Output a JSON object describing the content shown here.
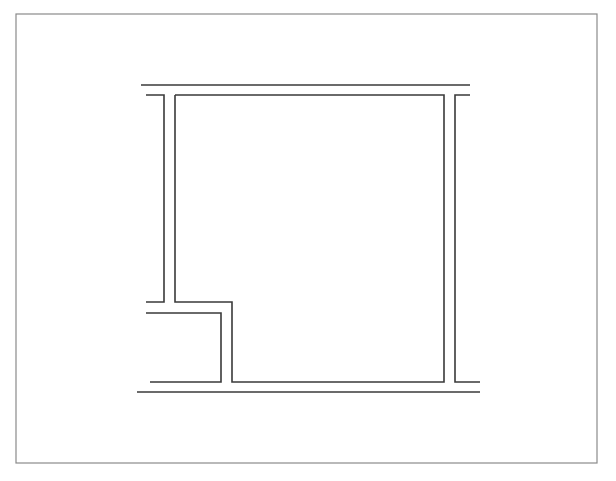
{
  "diagram": {
    "type": "floor-plan",
    "background": "#ffffff",
    "stroke_color": "#3a3a3a",
    "frame_color": "#8a8a8a",
    "frame": {
      "x": 16,
      "y": 14,
      "width": 581,
      "height": 449
    },
    "walls": [
      {
        "id": "top-line",
        "points": [
          [
            141,
            85
          ],
          [
            470,
            85
          ]
        ]
      },
      {
        "id": "left-outer-wall",
        "points": [
          [
            146,
            95
          ],
          [
            164,
            95
          ],
          [
            164,
            302
          ],
          [
            146,
            302
          ]
        ]
      },
      {
        "id": "room-inner-outline",
        "points": [
          [
            175,
            95
          ],
          [
            444,
            95
          ],
          [
            444,
            382
          ],
          [
            232,
            382
          ],
          [
            232,
            302
          ],
          [
            175,
            302
          ],
          [
            175,
            95
          ]
        ]
      },
      {
        "id": "notch-outer",
        "points": [
          [
            146,
            313
          ],
          [
            221,
            313
          ],
          [
            221,
            382
          ],
          [
            150,
            382
          ]
        ]
      },
      {
        "id": "right-outer-wall",
        "points": [
          [
            470,
            95
          ],
          [
            455,
            95
          ],
          [
            455,
            382
          ],
          [
            480,
            382
          ]
        ]
      },
      {
        "id": "bottom-line",
        "points": [
          [
            137,
            392
          ],
          [
            480,
            392
          ]
        ]
      }
    ]
  }
}
